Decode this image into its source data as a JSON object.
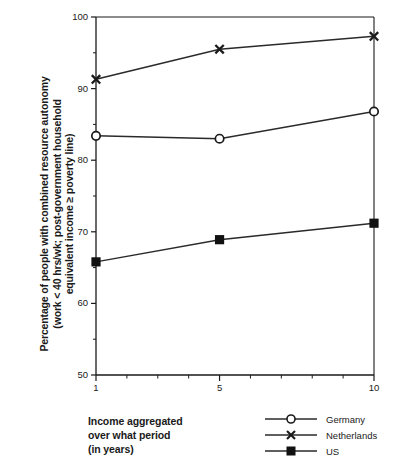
{
  "chart_data": {
    "type": "line",
    "title": "",
    "xlabel": "Income aggregated over what period (in years)",
    "ylabel": "Percentage of people with combined resource autonomy (work < 40 hrs/wk; post-government household equivalent income ≥ poverty line)",
    "x": [
      1,
      5,
      10
    ],
    "xlim": [
      1,
      10
    ],
    "ylim": [
      50,
      100
    ],
    "xtick_labels": [
      "1",
      "5",
      "10"
    ],
    "xticks": [
      1,
      5,
      10
    ],
    "yticks": [
      50,
      60,
      70,
      80,
      90,
      100
    ],
    "ytick_labels": [
      "50",
      "60",
      "70",
      "80",
      "90",
      "100"
    ],
    "yminor_ticks": [
      55,
      65,
      75,
      85,
      95
    ],
    "xminor_ticks": [
      2,
      3,
      4,
      6,
      7,
      8,
      9
    ],
    "grid": false,
    "legend_position": "bottom-right",
    "series": [
      {
        "name": "Germany",
        "marker": "open-circle",
        "values": [
          83.4,
          83.0,
          86.8
        ]
      },
      {
        "name": "Netherlands",
        "marker": "cross-x",
        "values": [
          91.3,
          95.5,
          97.3
        ]
      },
      {
        "name": "US",
        "marker": "filled-square",
        "values": [
          65.8,
          68.9,
          71.2
        ]
      }
    ]
  },
  "axis": {
    "y_title_lines": [
      "Percentage of people with combined resource autonomy",
      "(work < 40 hrs/wk; post-government household",
      "equivalent income ≥ poverty line)"
    ],
    "x_caption_lines": [
      "Income aggregated",
      "over what period",
      "(in years)"
    ]
  },
  "legend": {
    "items": [
      {
        "label": "Germany",
        "marker": "open-circle"
      },
      {
        "label": "Netherlands",
        "marker": "cross-x"
      },
      {
        "label": "US",
        "marker": "filled-square"
      }
    ]
  },
  "colors": {
    "ink": "#1a1a1a",
    "background": "#ffffff",
    "line": "#2a2a2a"
  }
}
